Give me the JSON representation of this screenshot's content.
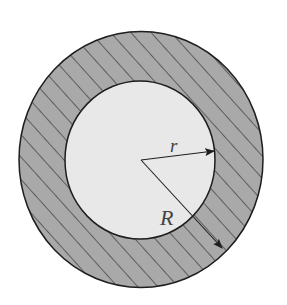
{
  "diagram": {
    "type": "annulus",
    "colors": {
      "background": "#ffffff",
      "inner_fill": "#e8e8e8",
      "ring_fill": "#a9a9a9",
      "hatch": "#2a2a2a",
      "stroke": "#1e1e1e",
      "label": "#444444"
    },
    "labels": {
      "inner_radius": "r",
      "outer_radius": "R"
    }
  }
}
